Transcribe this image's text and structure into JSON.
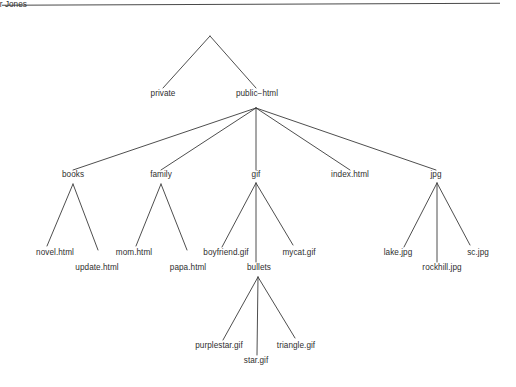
{
  "diagram": {
    "type": "tree",
    "background_color": "#ffffff",
    "line_color": "#3a3a3a",
    "text_color": "#2f2f2f",
    "rule": {
      "name": "top-horizontal-rule",
      "color": "#4a4a4a"
    },
    "nodes": {
      "root": {
        "label": "Jennifer Jones",
        "x": 210,
        "y": 22
      },
      "private": {
        "label": "private",
        "x": 163,
        "y": 96
      },
      "public_html": {
        "label": "public−html",
        "x": 257,
        "y": 96
      },
      "books": {
        "label": "books",
        "x": 73,
        "y": 177
      },
      "family": {
        "label": "family",
        "x": 161,
        "y": 177
      },
      "gif": {
        "label": "gif",
        "x": 256,
        "y": 177
      },
      "index_html": {
        "label": "index.html",
        "x": 350,
        "y": 177
      },
      "jpg": {
        "label": "jpg",
        "x": 436,
        "y": 177
      },
      "novel_html": {
        "label": "novel.html",
        "x": 55,
        "y": 255
      },
      "update_html": {
        "label": "update.html",
        "x": 97,
        "y": 270
      },
      "mom_html": {
        "label": "mom.html",
        "x": 134,
        "y": 255
      },
      "papa_html": {
        "label": "papa.html",
        "x": 188,
        "y": 270
      },
      "boyfriend_gif": {
        "label": "boyfriend.gif",
        "x": 226,
        "y": 255
      },
      "bullets": {
        "label": "bullets",
        "x": 259,
        "y": 270
      },
      "mycat_gif": {
        "label": "mycat.gif",
        "x": 299,
        "y": 255
      },
      "lake_jpg": {
        "label": "lake.jpg",
        "x": 398,
        "y": 255
      },
      "rockhill_jpg": {
        "label": "rockhill.jpg",
        "x": 442,
        "y": 270
      },
      "sc_jpg": {
        "label": "sc.jpg",
        "x": 478,
        "y": 255
      },
      "purplestar_gif": {
        "label": "purplestar.gif",
        "x": 219,
        "y": 348
      },
      "star_gif": {
        "label": "star.gif",
        "x": 256,
        "y": 363
      },
      "triangle_gif": {
        "label": "triangle.gif",
        "x": 296,
        "y": 348
      }
    },
    "edges": [
      {
        "from": "root",
        "to": "private",
        "x1": 210,
        "y1": 36,
        "x2": 163,
        "y2": 88
      },
      {
        "from": "root",
        "to": "public_html",
        "x1": 210,
        "y1": 36,
        "x2": 256,
        "y2": 88
      },
      {
        "from": "public_html",
        "to": "books",
        "x1": 256,
        "y1": 108,
        "x2": 73,
        "y2": 170
      },
      {
        "from": "public_html",
        "to": "family",
        "x1": 256,
        "y1": 108,
        "x2": 161,
        "y2": 170
      },
      {
        "from": "public_html",
        "to": "gif",
        "x1": 256,
        "y1": 108,
        "x2": 256,
        "y2": 170
      },
      {
        "from": "public_html",
        "to": "index_html",
        "x1": 256,
        "y1": 108,
        "x2": 350,
        "y2": 170
      },
      {
        "from": "public_html",
        "to": "jpg",
        "x1": 256,
        "y1": 108,
        "x2": 436,
        "y2": 170
      },
      {
        "from": "books",
        "to": "novel_html",
        "x1": 73,
        "y1": 184,
        "x2": 47,
        "y2": 246
      },
      {
        "from": "books",
        "to": "update_html",
        "x1": 73,
        "y1": 184,
        "x2": 98,
        "y2": 250
      },
      {
        "from": "family",
        "to": "mom_html",
        "x1": 161,
        "y1": 184,
        "x2": 136,
        "y2": 246
      },
      {
        "from": "family",
        "to": "papa_html",
        "x1": 161,
        "y1": 184,
        "x2": 187,
        "y2": 250
      },
      {
        "from": "gif",
        "to": "boyfriend_gif",
        "x1": 256,
        "y1": 183,
        "x2": 222,
        "y2": 247
      },
      {
        "from": "gif",
        "to": "bullets",
        "x1": 256,
        "y1": 183,
        "x2": 256,
        "y2": 262
      },
      {
        "from": "gif",
        "to": "mycat_gif",
        "x1": 256,
        "y1": 183,
        "x2": 293,
        "y2": 245
      },
      {
        "from": "jpg",
        "to": "lake_jpg",
        "x1": 437,
        "y1": 183,
        "x2": 404,
        "y2": 247
      },
      {
        "from": "jpg",
        "to": "rockhill_jpg",
        "x1": 437,
        "y1": 183,
        "x2": 437,
        "y2": 262
      },
      {
        "from": "jpg",
        "to": "sc_jpg",
        "x1": 437,
        "y1": 183,
        "x2": 470,
        "y2": 245
      },
      {
        "from": "bullets",
        "to": "purplestar_gif",
        "x1": 258,
        "y1": 277,
        "x2": 223,
        "y2": 340
      },
      {
        "from": "bullets",
        "to": "star_gif",
        "x1": 258,
        "y1": 277,
        "x2": 257,
        "y2": 355
      },
      {
        "from": "bullets",
        "to": "triangle_gif",
        "x1": 258,
        "y1": 277,
        "x2": 295,
        "y2": 338
      }
    ]
  }
}
